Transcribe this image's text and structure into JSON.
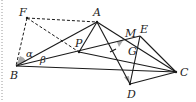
{
  "diagram": {
    "type": "geometry-figure",
    "colors": {
      "line": "#1a1a1a",
      "angle_fill": "#a8a8a8",
      "border": "#9a9a9a"
    },
    "points": {
      "F": {
        "label": "F",
        "x": 27,
        "y": 18
      },
      "A": {
        "label": "A",
        "x": 97,
        "y": 22
      },
      "B": {
        "label": "B",
        "x": 16,
        "y": 66
      },
      "C": {
        "label": "C",
        "x": 176,
        "y": 72
      },
      "D": {
        "label": "D",
        "x": 130,
        "y": 84
      },
      "E": {
        "label": "E",
        "x": 140,
        "y": 36
      },
      "P": {
        "label": "P",
        "x": 79,
        "y": 52
      },
      "M": {
        "label": "M",
        "x": 124,
        "y": 39
      },
      "G": {
        "label": "G",
        "x": 136,
        "y": 50
      }
    },
    "angle_labels": {
      "alpha": "α",
      "beta": "β"
    },
    "solid_segments": [
      "BA",
      "BC",
      "BE",
      "AD",
      "AC",
      "DE",
      "DC",
      "EC",
      "PC"
    ],
    "dashed_segments": [
      "FA",
      "FB",
      "FP"
    ],
    "shaded_angles": [
      "at B (alpha)",
      "at M",
      "at D"
    ]
  }
}
